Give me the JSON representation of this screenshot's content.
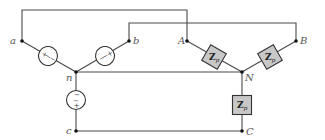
{
  "diagram": {
    "type": "three-phase wye-wye circuit",
    "nodes": {
      "a": "a",
      "b": "b",
      "c": "c",
      "n": "n",
      "A": "A",
      "B": "B",
      "C": "C",
      "N": "N"
    },
    "sources": [
      {
        "id": "source-an",
        "symbol": "~",
        "plus": "+",
        "minus": "−"
      },
      {
        "id": "source-bn",
        "symbol": "~",
        "plus": "+",
        "minus": "−"
      },
      {
        "id": "source-cn",
        "symbol": "~",
        "plus": "+",
        "minus": "−"
      }
    ],
    "impedances": [
      {
        "id": "load-AN",
        "label": "Z",
        "subscript": "p"
      },
      {
        "id": "load-BN",
        "label": "Z",
        "subscript": "p"
      },
      {
        "id": "load-CN",
        "label": "Z",
        "subscript": "p"
      }
    ],
    "colors": {
      "wire": "#4a4a4a",
      "impedance_fill": "#c8c8c8",
      "label": "#555555"
    }
  }
}
